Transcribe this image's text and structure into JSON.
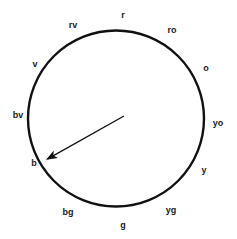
{
  "diagram": {
    "background_color": "#ffffff",
    "stroke_color": "#111111",
    "text_color": "#1a1a1a",
    "circle": {
      "cx": 116,
      "cy": 118.5,
      "r": 88,
      "stroke_width": 2.4
    },
    "arrow": {
      "x1": 124,
      "y1": 116,
      "x2": 42,
      "y2": 162,
      "stroke_width": 1.4,
      "head_length": 11,
      "head_width": 5,
      "points_to": "b"
    },
    "labels": [
      {
        "text": "r",
        "x": 123,
        "y": 15,
        "angle_deg": 90
      },
      {
        "text": "ro",
        "x": 172,
        "y": 30,
        "angle_deg": 60
      },
      {
        "text": "o",
        "x": 206,
        "y": 68,
        "angle_deg": 30
      },
      {
        "text": "yo",
        "x": 218,
        "y": 123,
        "angle_deg": 0
      },
      {
        "text": "y",
        "x": 204,
        "y": 170,
        "angle_deg": -30
      },
      {
        "text": "yg",
        "x": 171,
        "y": 210,
        "angle_deg": -60
      },
      {
        "text": "g",
        "x": 123,
        "y": 225,
        "angle_deg": -90
      },
      {
        "text": "bg",
        "x": 68,
        "y": 212,
        "angle_deg": -120
      },
      {
        "text": "b",
        "x": 34,
        "y": 163,
        "angle_deg": -150
      },
      {
        "text": "bv",
        "x": 18,
        "y": 115,
        "angle_deg": 180
      },
      {
        "text": "v",
        "x": 35,
        "y": 64,
        "angle_deg": 150
      },
      {
        "text": "rv",
        "x": 73,
        "y": 25,
        "angle_deg": 120
      }
    ]
  }
}
